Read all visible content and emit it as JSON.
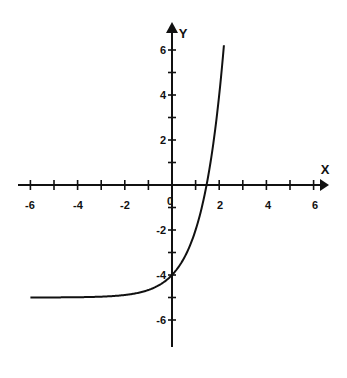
{
  "chart_data": {
    "type": "line",
    "title": "",
    "xlabel": "X",
    "ylabel": "Y",
    "function": "y = 3^x - 5",
    "xlim": [
      -6.5,
      6.5
    ],
    "ylim": [
      -7,
      6.5
    ],
    "grid": false,
    "legend": null,
    "x_ticks": [
      -6,
      -5,
      -4,
      -3,
      -2,
      -1,
      1,
      2,
      3,
      4,
      5,
      6
    ],
    "x_tick_labels": [
      "-6",
      "-4",
      "-2",
      "2",
      "4",
      "6"
    ],
    "y_ticks": [
      -6,
      -5,
      -4,
      -3,
      -2,
      -1,
      1,
      2,
      3,
      4,
      5,
      6
    ],
    "y_tick_labels": [
      "6",
      "4",
      "2",
      "-2",
      "-4",
      "-6"
    ],
    "origin_label": "0",
    "series": [
      {
        "name": "curve",
        "x": [
          -6,
          -5,
          -4,
          -3,
          -2,
          -1,
          0,
          0.5,
          1,
          1.465,
          1.8,
          2,
          2.2
        ],
        "y": [
          -5.0,
          -5.0,
          -4.99,
          -4.96,
          -4.89,
          -4.67,
          -4.0,
          -3.27,
          -2.0,
          0.0,
          2.24,
          4.0,
          6.2
        ]
      }
    ],
    "annotations": {
      "y_intercept": -4,
      "x_intercept": 1.46,
      "horizontal_asymptote": -5
    }
  },
  "labels": {
    "x_axis": "X",
    "y_axis": "Y",
    "origin": "0",
    "x_ticks": {
      "m6": "-6",
      "m4": "-4",
      "m2": "-2",
      "p2": "2",
      "p4": "4",
      "p6": "6"
    },
    "y_ticks": {
      "p6": "6",
      "p4": "4",
      "p2": "2",
      "m2": "-2",
      "m4": "-4",
      "m6": "-6"
    }
  }
}
